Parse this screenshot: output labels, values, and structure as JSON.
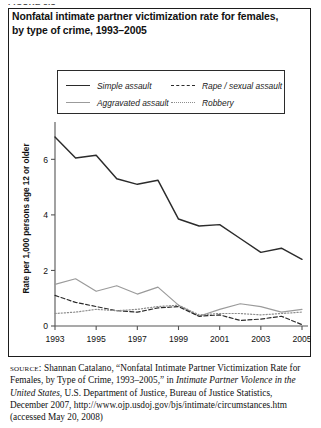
{
  "figure_label": "FIGURE 5.1",
  "title": "Nonfatal intimate partner victimization rate for females, by type of crime, 1993–2005",
  "legend": {
    "items": [
      {
        "label": "Simple assault",
        "style": "solid-dark",
        "color": "#2b2b2b"
      },
      {
        "label": "Rape / sexual assault",
        "style": "dashed",
        "color": "#2b2b2b"
      },
      {
        "label": "Aggravated assault",
        "style": "solid-gray",
        "color": "#9b9b9b"
      },
      {
        "label": "Robbery",
        "style": "dotted",
        "color": "#8d8d8d"
      }
    ]
  },
  "source": {
    "label": "source:",
    "text_1": " Shannan Catalano, “Nonfatal Intimate Partner Victimization Rate for Females, by Type of Crime, 1993–2005,” in ",
    "italic_1": "Intimate Partner Violence in the United States",
    "text_2": ", U.S. Department of Justice, Bureau of Justice Statistics, December 2007, http://www.ojp.usdoj.gov/bjs/intimate/circumstances.htm (accessed May 20, 2008)"
  },
  "chart_data": {
    "type": "line",
    "title": "Nonfatal intimate partner victimization rate for females, by type of crime, 1993–2005",
    "xlabel": "",
    "ylabel": "Rate per 1,000 persons age 12 or older",
    "x": [
      1993,
      1994,
      1995,
      1996,
      1997,
      1998,
      1999,
      2000,
      2001,
      2002,
      2003,
      2004,
      2005
    ],
    "xticks": [
      1993,
      1995,
      1997,
      1999,
      2001,
      2003,
      2005
    ],
    "yticks": [
      0,
      2,
      4,
      6
    ],
    "ylim": [
      0,
      7.2
    ],
    "xlim": [
      1993,
      2005
    ],
    "grid": false,
    "legend_position": "top",
    "series": [
      {
        "name": "Simple assault",
        "color": "#2b2b2b",
        "dash": "solid",
        "values": [
          6.8,
          6.05,
          6.15,
          5.3,
          5.1,
          5.25,
          3.85,
          3.6,
          3.65,
          3.15,
          2.65,
          2.8,
          2.4
        ]
      },
      {
        "name": "Aggravated assault",
        "color": "#9b9b9b",
        "dash": "solid",
        "values": [
          1.5,
          1.7,
          1.25,
          1.45,
          1.15,
          1.4,
          0.75,
          0.35,
          0.6,
          0.8,
          0.7,
          0.5,
          0.6
        ]
      },
      {
        "name": "Rape / sexual assault",
        "color": "#2b2b2b",
        "dash": "dashed",
        "values": [
          1.1,
          0.85,
          0.7,
          0.55,
          0.5,
          0.65,
          0.7,
          0.35,
          0.4,
          0.2,
          0.25,
          0.35,
          0.05
        ]
      },
      {
        "name": "Robbery",
        "color": "#8d8d8d",
        "dash": "dotted",
        "values": [
          0.45,
          0.5,
          0.6,
          0.55,
          0.6,
          0.7,
          0.75,
          0.4,
          0.45,
          0.45,
          0.4,
          0.45,
          0.5
        ]
      }
    ]
  }
}
